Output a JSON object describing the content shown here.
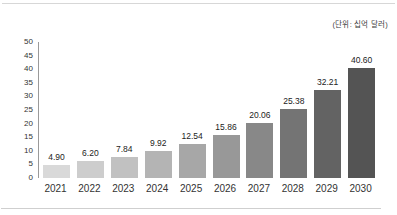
{
  "unit_annotation": "(단위: 십억 달러)",
  "colors": {
    "background": "#ffffff",
    "rule": "#d7d7d7",
    "axis_line": "#9a9a9a",
    "tick_text": "#333333",
    "value_text": "#1c1c1c"
  },
  "chart_data": {
    "type": "bar",
    "title": "",
    "xlabel": "",
    "ylabel": "",
    "unit_annotation": "(단위: 십억 달러)",
    "categories": [
      "2021",
      "2022",
      "2023",
      "2024",
      "2025",
      "2026",
      "2027",
      "2028",
      "2029",
      "2030"
    ],
    "values": [
      4.9,
      6.2,
      7.84,
      9.92,
      12.54,
      15.86,
      20.06,
      25.38,
      32.21,
      40.6
    ],
    "value_labels": [
      "4.90",
      "6.20",
      "7.84",
      "9.92",
      "12.54",
      "15.86",
      "20.06",
      "25.38",
      "32.21",
      "40.60"
    ],
    "ylim": [
      0,
      50
    ],
    "yticks": [
      0,
      5,
      10,
      15,
      20,
      25,
      30,
      35,
      40,
      45,
      50
    ],
    "grid": false,
    "legend_position": "none",
    "bar_colors": [
      "#d9d9d9",
      "#cdcdcd",
      "#c1c1c1",
      "#b4b4b4",
      "#a7a7a7",
      "#989898",
      "#888888",
      "#747474",
      "#636363",
      "#545454"
    ]
  }
}
